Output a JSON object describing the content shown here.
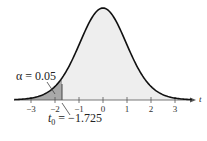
{
  "chart_data": {
    "type": "area",
    "title": "",
    "xlabel": "t",
    "ylabel": "",
    "xlim": [
      -3.5,
      3.5
    ],
    "ticks": [
      "-3",
      "-2",
      "-1",
      "0",
      "1",
      "2",
      "3"
    ],
    "tick_values": [
      -3,
      -2,
      -1,
      0,
      1,
      2,
      3
    ],
    "distribution": "t",
    "critical_value": -1.725,
    "alpha": 0.05,
    "shaded_region": "left tail, t < -1.725",
    "annotations": [
      "α = 0.05",
      "t0 = −1.725"
    ],
    "grid": false,
    "legend": "none"
  },
  "labels": {
    "alpha": "α = 0.05",
    "t0_prefix": "t",
    "t0_sub": "0",
    "t0_value": " = −1.725",
    "axis": "t"
  }
}
